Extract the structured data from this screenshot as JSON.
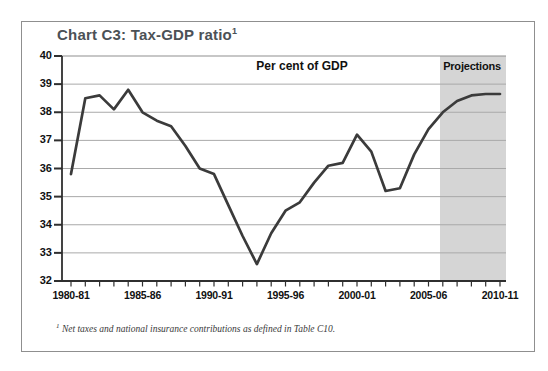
{
  "chart_data": {
    "type": "line",
    "title": "Chart C3: Tax-GDP ratio",
    "footnote_marker": "1",
    "inner_label": "Per cent of GDP",
    "projections": {
      "label": "Projections",
      "starts_after": "2005-06"
    },
    "footnote": "Net taxes and national insurance contributions as defined in Table C10.",
    "ylim": [
      32,
      40
    ],
    "y_ticks": [
      40,
      39,
      38,
      37,
      36,
      35,
      34,
      33,
      32
    ],
    "x_tick_labels": [
      "1980-81",
      "1985-86",
      "1990-91",
      "1995-96",
      "2000-01",
      "2005-06",
      "2010-11"
    ],
    "categories": [
      "1980-81",
      "1981-82",
      "1982-83",
      "1983-84",
      "1984-85",
      "1985-86",
      "1986-87",
      "1987-88",
      "1988-89",
      "1989-90",
      "1990-91",
      "1991-92",
      "1992-93",
      "1993-94",
      "1994-95",
      "1995-96",
      "1996-97",
      "1997-98",
      "1998-99",
      "1999-00",
      "2000-01",
      "2001-02",
      "2002-03",
      "2003-04",
      "2004-05",
      "2005-06",
      "2006-07",
      "2007-08",
      "2008-09",
      "2009-10",
      "2010-11"
    ],
    "values": [
      35.8,
      38.5,
      38.6,
      38.1,
      38.8,
      38.0,
      37.7,
      37.5,
      36.8,
      36.0,
      35.8,
      34.7,
      33.6,
      32.6,
      33.7,
      34.5,
      34.8,
      35.5,
      36.1,
      36.2,
      37.2,
      36.6,
      35.2,
      35.3,
      36.5,
      37.4,
      38.0,
      38.4,
      38.6,
      38.65,
      38.65
    ],
    "series_name": "Tax-GDP ratio (per cent of GDP)",
    "grid": "horizontal",
    "legend": "none",
    "colors": {
      "line": "#3b3b3b",
      "projection_shading": "#d5d5d5",
      "gridline": "#a9a9a9",
      "axis": "#2f2f2f",
      "label_text": "#111111",
      "title_text": "#4b5156",
      "frame_border": "#8f8f8f",
      "background": "#ffffff"
    }
  }
}
